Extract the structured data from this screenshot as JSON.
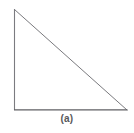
{
  "figure": {
    "caption": "(a)",
    "background_color": "#ffffff",
    "stroke_color": "#7a7a7e",
    "base_stroke_color": "#5f5f63",
    "caption_color": "#58585a",
    "stroke_width": 1,
    "canvas": {
      "width": 134,
      "height": 133
    },
    "shape_name": "right-triangle",
    "vertices": {
      "apex": {
        "x": 14,
        "y": 9
      },
      "bottom_left": {
        "x": 14,
        "y": 110
      },
      "bottom_right": {
        "x": 127,
        "y": 110
      }
    },
    "edges": [
      {
        "name": "vertical-leg",
        "from": "apex",
        "to": "bottom_left"
      },
      {
        "name": "horizontal-leg",
        "from": "bottom_left",
        "to": "bottom_right"
      },
      {
        "name": "hypotenuse",
        "from": "apex",
        "to": "bottom_right"
      }
    ]
  },
  "chart_data": {
    "type": "line",
    "title": "(a)",
    "xlabel": "",
    "ylabel": "",
    "grid": false,
    "legend": "none",
    "xlim": [
      14,
      127
    ],
    "ylim": [
      9,
      110
    ],
    "series": [
      {
        "name": "vertical-leg",
        "x": [
          14,
          14
        ],
        "y": [
          9,
          110
        ]
      },
      {
        "name": "horizontal-leg",
        "x": [
          14,
          127
        ],
        "y": [
          110,
          110
        ]
      },
      {
        "name": "hypotenuse",
        "x": [
          14,
          127
        ],
        "y": [
          9,
          110
        ]
      }
    ],
    "annotations": [
      {
        "text": "(a)",
        "x": 67,
        "y": 119
      }
    ]
  }
}
